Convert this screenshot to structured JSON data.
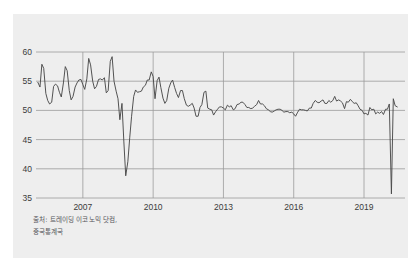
{
  "figure": {
    "background_color": "#ffffff",
    "panel_color": "#eeeeee",
    "line_color": "#4a4a4a",
    "grid_color": "#9a9a9a",
    "text_color": "#3b3b3b"
  },
  "source": {
    "line1": "출처: 트레이딩 이코노믹 닷컴,",
    "line2": "중국통계국"
  },
  "chart_data": {
    "type": "line",
    "title": "",
    "subtitle": "",
    "xlabel": "",
    "ylabel": "",
    "xlim": [
      2005.0,
      2020.75
    ],
    "ylim": [
      35,
      60
    ],
    "grid": true,
    "legend": "none",
    "xticks": [
      "2007",
      "2010",
      "2013",
      "2016",
      "2019"
    ],
    "xtick_values": [
      2007,
      2010,
      2013,
      2016,
      2019
    ],
    "yticks": [
      "60",
      "55",
      "50",
      "45",
      "40",
      "35"
    ],
    "ytick_values": [
      60,
      55,
      50,
      45,
      40,
      35
    ],
    "annotations": [],
    "series": [
      {
        "name": "China Manufacturing PMI",
        "x": [
          2005.08,
          2005.17,
          2005.25,
          2005.33,
          2005.42,
          2005.5,
          2005.58,
          2005.67,
          2005.75,
          2005.83,
          2005.92,
          2006.0,
          2006.08,
          2006.17,
          2006.25,
          2006.33,
          2006.42,
          2006.5,
          2006.58,
          2006.67,
          2006.75,
          2006.83,
          2006.92,
          2007.0,
          2007.08,
          2007.17,
          2007.25,
          2007.33,
          2007.42,
          2007.5,
          2007.58,
          2007.67,
          2007.75,
          2007.83,
          2007.92,
          2008.0,
          2008.08,
          2008.17,
          2008.25,
          2008.33,
          2008.42,
          2008.5,
          2008.58,
          2008.67,
          2008.75,
          2008.83,
          2008.92,
          2009.0,
          2009.08,
          2009.17,
          2009.25,
          2009.33,
          2009.42,
          2009.5,
          2009.58,
          2009.67,
          2009.75,
          2009.83,
          2009.92,
          2010.0,
          2010.08,
          2010.17,
          2010.25,
          2010.33,
          2010.42,
          2010.5,
          2010.58,
          2010.67,
          2010.75,
          2010.83,
          2010.92,
          2011.0,
          2011.08,
          2011.17,
          2011.25,
          2011.33,
          2011.42,
          2011.5,
          2011.58,
          2011.67,
          2011.75,
          2011.83,
          2011.92,
          2012.0,
          2012.08,
          2012.17,
          2012.25,
          2012.33,
          2012.42,
          2012.5,
          2012.58,
          2012.67,
          2012.75,
          2012.83,
          2012.92,
          2013.0,
          2013.08,
          2013.17,
          2013.25,
          2013.33,
          2013.42,
          2013.5,
          2013.58,
          2013.67,
          2013.75,
          2013.83,
          2013.92,
          2014.0,
          2014.08,
          2014.17,
          2014.25,
          2014.33,
          2014.42,
          2014.5,
          2014.58,
          2014.67,
          2014.75,
          2014.83,
          2014.92,
          2015.0,
          2015.08,
          2015.17,
          2015.25,
          2015.33,
          2015.42,
          2015.5,
          2015.58,
          2015.67,
          2015.75,
          2015.83,
          2015.92,
          2016.0,
          2016.08,
          2016.17,
          2016.25,
          2016.33,
          2016.42,
          2016.5,
          2016.58,
          2016.67,
          2016.75,
          2016.83,
          2016.92,
          2017.0,
          2017.08,
          2017.17,
          2017.25,
          2017.33,
          2017.42,
          2017.5,
          2017.58,
          2017.67,
          2017.75,
          2017.83,
          2017.92,
          2018.0,
          2018.08,
          2018.17,
          2018.25,
          2018.33,
          2018.42,
          2018.5,
          2018.58,
          2018.67,
          2018.75,
          2018.83,
          2018.92,
          2019.0,
          2019.08,
          2019.17,
          2019.25,
          2019.33,
          2019.42,
          2019.5,
          2019.58,
          2019.67,
          2019.75,
          2019.83,
          2019.92,
          2020.0,
          2020.08,
          2020.17,
          2020.25,
          2020.33,
          2020.42
        ],
        "values": [
          54.8,
          54.0,
          57.9,
          57.2,
          52.9,
          51.7,
          51.1,
          51.4,
          54.1,
          54.5,
          54.2,
          53.1,
          52.3,
          54.7,
          57.5,
          56.8,
          53.4,
          51.8,
          52.4,
          54.0,
          54.7,
          55.2,
          55.3,
          54.4,
          53.6,
          55.4,
          58.9,
          57.8,
          55.0,
          53.7,
          54.1,
          55.3,
          55.4,
          55.2,
          55.6,
          53.0,
          53.4,
          58.4,
          59.2,
          55.0,
          53.3,
          52.0,
          48.4,
          51.2,
          44.6,
          38.8,
          41.2,
          45.3,
          49.0,
          52.4,
          53.5,
          53.1,
          53.2,
          53.3,
          54.0,
          54.3,
          55.2,
          55.2,
          56.6,
          55.8,
          52.0,
          55.1,
          55.7,
          53.9,
          52.1,
          51.2,
          51.7,
          53.8,
          54.7,
          55.2,
          53.9,
          52.9,
          52.2,
          53.4,
          53.4,
          52.0,
          50.9,
          50.7,
          50.9,
          51.2,
          50.4,
          49.0,
          49.0,
          50.5,
          51.0,
          53.1,
          53.3,
          50.4,
          50.2,
          50.1,
          49.2,
          49.8,
          50.2,
          50.6,
          50.6,
          50.4,
          50.1,
          50.9,
          50.6,
          50.8,
          50.1,
          50.3,
          51.0,
          51.1,
          51.4,
          51.4,
          51.0,
          50.5,
          50.5,
          50.3,
          50.4,
          50.7,
          51.0,
          51.7,
          51.1,
          51.1,
          50.8,
          50.3,
          50.1,
          49.8,
          49.7,
          49.9,
          50.1,
          50.2,
          50.2,
          50.0,
          49.7,
          49.8,
          49.8,
          49.6,
          49.7,
          49.4,
          49.0,
          49.7,
          50.2,
          50.1,
          50.1,
          50.0,
          49.9,
          50.4,
          50.4,
          51.2,
          51.7,
          51.4,
          51.3,
          51.6,
          51.8,
          51.2,
          51.2,
          51.7,
          51.4,
          51.7,
          52.4,
          51.6,
          51.8,
          51.6,
          51.3,
          50.3,
          51.5,
          51.4,
          51.9,
          51.5,
          51.2,
          51.3,
          50.8,
          50.2,
          50.0,
          49.4,
          49.5,
          49.2,
          50.5,
          50.1,
          50.2,
          49.4,
          49.7,
          49.5,
          49.8,
          49.3,
          50.2,
          50.2,
          51.1,
          35.7,
          52.0,
          50.8,
          50.6
        ]
      }
    ]
  }
}
